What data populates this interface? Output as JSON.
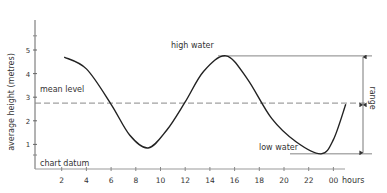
{
  "chart_data": {
    "type": "line",
    "title": "",
    "xlabel": "hours",
    "ylabel": "average height (metres)",
    "x_ticks": [
      2,
      4,
      6,
      8,
      10,
      12,
      14,
      16,
      18,
      20,
      22,
      24
    ],
    "x_tick_labels": [
      "2",
      "4",
      "6",
      "8",
      "10",
      "12",
      "14",
      "16",
      "18",
      "20",
      "22",
      "00"
    ],
    "y_ticks": [
      1,
      2,
      3,
      4,
      5
    ],
    "y_tick_labels": [
      "1",
      "2",
      "3",
      "4",
      "5"
    ],
    "xlim": [
      0,
      26
    ],
    "ylim": [
      0,
      6
    ],
    "grid": false,
    "series": [
      {
        "name": "tide height",
        "x": [
          2.2,
          4,
          6,
          7.5,
          9,
          10.5,
          12,
          13.5,
          15.3,
          17,
          19,
          21,
          23,
          24,
          25
        ],
        "values": [
          4.7,
          4.2,
          2.7,
          1.4,
          0.85,
          1.6,
          2.8,
          4.1,
          4.75,
          3.8,
          2.1,
          1.1,
          0.6,
          1.2,
          2.7
        ]
      }
    ],
    "reference_lines": [
      {
        "label": "mean level",
        "y": 2.75,
        "style": "dashed"
      },
      {
        "label": "chart datum",
        "y": 0,
        "style": "solid"
      },
      {
        "label": "high water",
        "y": 4.75,
        "style": "solid"
      },
      {
        "label": "low water",
        "y": 0.6,
        "style": "solid"
      }
    ],
    "annotations": [
      {
        "text": "high water",
        "x": 13.5,
        "y": 4.75
      },
      {
        "text": "low water",
        "x": 21,
        "y": 0.6
      },
      {
        "text": "mean level",
        "x": 0.5,
        "y": 2.75
      },
      {
        "text": "chart datum",
        "x": 0.5,
        "y": 0
      },
      {
        "text": "range",
        "between": [
          0.6,
          4.75
        ]
      }
    ]
  },
  "labels": {
    "ylabel": "average height (metres)",
    "xlabel": "hours",
    "mean_level": "mean level",
    "chart_datum": "chart datum",
    "high_water": "high water",
    "low_water": "low water",
    "range": "range"
  }
}
